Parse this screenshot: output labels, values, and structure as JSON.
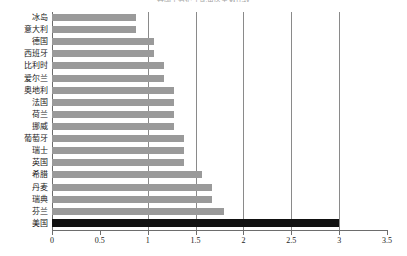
{
  "chart_data": {
    "type": "bar",
    "orientation": "horizontal",
    "title": "各国千名护士配备医生数比较",
    "xlabel": "",
    "ylabel": "",
    "xlim": [
      0,
      3.5
    ],
    "xticks": [
      "0",
      "0.5",
      "1",
      "1.5",
      "2",
      "2.5",
      "3",
      "3.5"
    ],
    "gridlines": [
      1,
      1.5,
      2,
      2.5,
      3
    ],
    "grid": true,
    "legend": null,
    "categories": [
      "冰岛",
      "意大利",
      "德国",
      "西班牙",
      "比利时",
      "爱尔兰",
      "奥地利",
      "法国",
      "荷兰",
      "挪威",
      "葡萄牙",
      "瑞士",
      "英国",
      "希腊",
      "丹麦",
      "瑞典",
      "芬兰",
      "美国"
    ],
    "values": [
      0.88,
      0.88,
      1.07,
      1.07,
      1.17,
      1.17,
      1.27,
      1.27,
      1.27,
      1.27,
      1.38,
      1.38,
      1.38,
      1.57,
      1.67,
      1.67,
      1.8,
      3.0
    ],
    "highlight_index": 17,
    "colors": {
      "bar": "#9a9a9a",
      "highlight_bar": "#111111",
      "axis": "#6d6d6d",
      "gridline": "#8a8a8a",
      "background": "#ffffff",
      "text": "#1a1a1a"
    }
  }
}
